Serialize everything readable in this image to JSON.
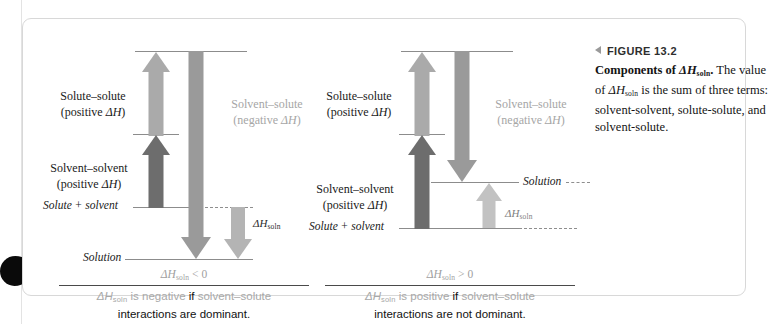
{
  "figure": {
    "caption_marker": "left-triangle",
    "figure_number": "FIGURE 13.2",
    "caption_lead": "Components of ",
    "caption_lead_symbol": "ΔH",
    "caption_lead_sub": "soln",
    "caption_rest": ". The value of ΔHsoln is the sum of three terms: solvent-solvent, solute-solute, and solvent-solute."
  },
  "symbols": {
    "delta_h": "ΔH",
    "soln_sub": "soln",
    "delta": "Δ",
    "H": "H"
  },
  "panels": [
    {
      "id": "left",
      "case": "exothermic",
      "levels": [
        {
          "name": "top-level",
          "label": ""
        },
        {
          "name": "middle-level",
          "label": ""
        },
        {
          "name": "solute-plus-solvent-level",
          "label": "Solute + solvent"
        },
        {
          "name": "solution-level",
          "label": "Solution"
        }
      ],
      "terms": [
        {
          "name": "solute-solute",
          "line1": "Solute–solute",
          "line2_pre": "(positive ",
          "line2_sym": "ΔH",
          "line2_post": ")",
          "color": "#1a1a1a",
          "arrow_color": "#aaaaaa",
          "direction": "up"
        },
        {
          "name": "solvent-solvent",
          "line1": "Solvent–solvent",
          "line2_pre": "(positive ",
          "line2_sym": "ΔH",
          "line2_post": ")",
          "color": "#1a1a1a",
          "arrow_color": "#6d6d6d",
          "direction": "up"
        },
        {
          "name": "solvent-solute",
          "line1": "Solvent–solute",
          "line2_pre": "(negative ",
          "line2_sym": "ΔH",
          "line2_post": ")",
          "color": "#a6a6a6",
          "arrow_color": "#9a9a9a",
          "direction": "down"
        }
      ],
      "dh_soln": {
        "label_sym": "ΔH",
        "label_sub": "soln",
        "direction": "down",
        "arrow_color": "#b4b4b4"
      },
      "conclusion": {
        "inequality_sym": "ΔH",
        "inequality_sub": "soln",
        "inequality_op": " < 0",
        "sentence_faded_a": " is negative",
        "sentence_bold": " if ",
        "sentence_faded_b": "solvent–solute",
        "sentence_line2": "interactions are dominant."
      }
    },
    {
      "id": "right",
      "case": "endothermic",
      "levels": [
        {
          "name": "top-level",
          "label": ""
        },
        {
          "name": "middle-level",
          "label": ""
        },
        {
          "name": "solution-level",
          "label": "Solution"
        },
        {
          "name": "solute-plus-solvent-level",
          "label": "Solute + solvent"
        }
      ],
      "terms": [
        {
          "name": "solute-solute",
          "line1": "Solute–solute",
          "line2_pre": "(positive ",
          "line2_sym": "ΔH",
          "line2_post": ")",
          "color": "#1a1a1a",
          "arrow_color": "#aaaaaa",
          "direction": "up"
        },
        {
          "name": "solvent-solvent",
          "line1": "Solvent–solvent",
          "line2_pre": "(positive ",
          "line2_sym": "ΔH",
          "line2_post": ")",
          "color": "#1a1a1a",
          "arrow_color": "#6d6d6d",
          "direction": "up"
        },
        {
          "name": "solvent-solute",
          "line1": "Solvent–solute",
          "line2_pre": "(negative ",
          "line2_sym": "ΔH",
          "line2_post": ")",
          "color": "#a6a6a6",
          "arrow_color": "#9a9a9a",
          "direction": "down"
        }
      ],
      "dh_soln": {
        "label_sym": "ΔH",
        "label_sub": "soln",
        "direction": "up",
        "arrow_color": "#c2c2c2"
      },
      "conclusion": {
        "inequality_sym": "ΔH",
        "inequality_sub": "soln",
        "inequality_op": " > 0",
        "sentence_faded_a": " is positive",
        "sentence_bold": " if ",
        "sentence_faded_b": "solvent–solute",
        "sentence_line2": "interactions are not dominant."
      }
    }
  ],
  "colors": {
    "frame_border": "#d8d8d8",
    "level_line": "#8c8c8c",
    "arrow_light": "#aaaaaa",
    "arrow_dark": "#6d6d6d",
    "arrow_medium": "#9a9a9a",
    "arrow_pale": "#c2c2c2",
    "faded_text": "#a8a8a8"
  }
}
